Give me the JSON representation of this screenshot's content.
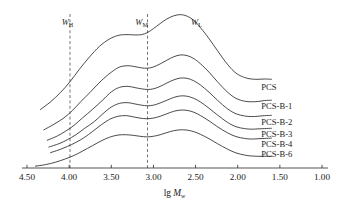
{
  "chart_data": {
    "type": "line",
    "title": "",
    "xlabel": "lg Mw",
    "xlabel_parts": {
      "prefix": "lg ",
      "symbol": "M",
      "subscript": "w"
    },
    "ylabel": "",
    "xlim": [
      4.5,
      1.0
    ],
    "x_axis_reversed": true,
    "xticks": [
      4.5,
      4.0,
      3.5,
      3.0,
      2.5,
      2.0,
      1.5,
      1.0
    ],
    "xticklabels": [
      "4.50",
      "4.00",
      "3.50",
      "3.00",
      "2.50",
      "2.00",
      "1.50",
      "1.00"
    ],
    "grid": false,
    "y_axis_visible": false,
    "legend_position": "right-inline",
    "note": "GPC molecular weight distribution traces, vertically offset; curves are bimodal with a shoulder near lg Mw 3.4 and a main peak near lg Mw 2.7",
    "annotations": [
      {
        "text": "WH",
        "symbol": "W",
        "subscript": "H",
        "x": 4.02,
        "y_frac": 0.93
      },
      {
        "text": "WM",
        "symbol": "W",
        "subscript": "M",
        "x": 3.14,
        "y_frac": 0.93
      },
      {
        "text": "WL",
        "symbol": "W",
        "subscript": "L",
        "x": 2.49,
        "y_frac": 0.93
      }
    ],
    "guide_lines": [
      {
        "x": 3.99,
        "style": "dashed"
      },
      {
        "x": 3.07,
        "style": "dashed"
      }
    ],
    "series": [
      {
        "name": "PCS",
        "label_x": 1.72,
        "label_y_frac": 0.525,
        "x": [
          4.34,
          4.22,
          4.1,
          3.99,
          3.88,
          3.76,
          3.64,
          3.52,
          3.41,
          3.3,
          3.22,
          3.14,
          3.07,
          3.0,
          2.92,
          2.84,
          2.76,
          2.68,
          2.6,
          2.52,
          2.44,
          2.34,
          2.24,
          2.12,
          2.02,
          1.92,
          1.84,
          1.76,
          1.68,
          1.6
        ],
        "values": [
          0.38,
          0.43,
          0.492,
          0.56,
          0.64,
          0.72,
          0.79,
          0.838,
          0.862,
          0.866,
          0.864,
          0.866,
          0.88,
          0.905,
          0.938,
          0.968,
          0.988,
          0.996,
          0.986,
          0.958,
          0.91,
          0.84,
          0.762,
          0.672,
          0.616,
          0.588,
          0.578,
          0.576,
          0.578,
          0.576
        ]
      },
      {
        "name": "PCS-B-1",
        "label_x": 1.72,
        "label_y_frac": 0.4,
        "x": [
          4.3,
          4.18,
          4.06,
          3.96,
          3.86,
          3.74,
          3.62,
          3.5,
          3.4,
          3.3,
          3.22,
          3.14,
          3.07,
          3.0,
          2.92,
          2.84,
          2.76,
          2.68,
          2.6,
          2.52,
          2.44,
          2.34,
          2.24,
          2.12,
          2.02,
          1.92,
          1.84,
          1.76,
          1.68,
          1.6
        ],
        "values": [
          0.248,
          0.284,
          0.326,
          0.374,
          0.432,
          0.498,
          0.566,
          0.622,
          0.656,
          0.664,
          0.658,
          0.65,
          0.648,
          0.656,
          0.676,
          0.7,
          0.722,
          0.734,
          0.73,
          0.71,
          0.676,
          0.622,
          0.56,
          0.492,
          0.452,
          0.434,
          0.43,
          0.432,
          0.438,
          0.44
        ]
      },
      {
        "name": "PCS-B-2",
        "label_x": 1.72,
        "label_y_frac": 0.3,
        "x": [
          4.26,
          4.14,
          4.04,
          3.94,
          3.84,
          3.72,
          3.6,
          3.5,
          3.4,
          3.3,
          3.22,
          3.14,
          3.07,
          3.0,
          2.92,
          2.84,
          2.76,
          2.68,
          2.6,
          2.52,
          2.44,
          2.34,
          2.24,
          2.12,
          2.02,
          1.92,
          1.84,
          1.76,
          1.68,
          1.6
        ],
        "values": [
          0.18,
          0.208,
          0.24,
          0.278,
          0.326,
          0.382,
          0.442,
          0.494,
          0.524,
          0.53,
          0.522,
          0.514,
          0.51,
          0.514,
          0.53,
          0.552,
          0.572,
          0.584,
          0.582,
          0.566,
          0.538,
          0.492,
          0.44,
          0.384,
          0.352,
          0.338,
          0.334,
          0.336,
          0.34,
          0.342
        ]
      },
      {
        "name": "PCS-B-3",
        "label_x": 1.72,
        "label_y_frac": 0.218,
        "x": [
          4.24,
          4.12,
          4.02,
          3.92,
          3.82,
          3.7,
          3.6,
          3.5,
          3.4,
          3.3,
          3.22,
          3.14,
          3.07,
          3.0,
          2.92,
          2.84,
          2.76,
          2.68,
          2.6,
          2.52,
          2.44,
          2.34,
          2.24,
          2.12,
          2.02,
          1.92,
          1.84,
          1.76,
          1.68,
          1.6
        ],
        "values": [
          0.136,
          0.158,
          0.184,
          0.216,
          0.256,
          0.302,
          0.352,
          0.396,
          0.42,
          0.424,
          0.416,
          0.408,
          0.404,
          0.408,
          0.422,
          0.44,
          0.458,
          0.468,
          0.466,
          0.452,
          0.428,
          0.388,
          0.344,
          0.296,
          0.268,
          0.256,
          0.252,
          0.254,
          0.256,
          0.258
        ]
      },
      {
        "name": "PCS-B-4",
        "label_x": 1.72,
        "label_y_frac": 0.158,
        "x": [
          4.22,
          4.12,
          4.02,
          3.92,
          3.82,
          3.72,
          3.62,
          3.52,
          3.42,
          3.32,
          3.24,
          3.16,
          3.08,
          3.0,
          2.92,
          2.84,
          2.76,
          2.68,
          2.6,
          2.52,
          2.44,
          2.34,
          2.24,
          2.12,
          2.02,
          1.92,
          1.84,
          1.76,
          1.68,
          1.6
        ],
        "values": [
          0.1,
          0.118,
          0.14,
          0.166,
          0.198,
          0.238,
          0.28,
          0.316,
          0.336,
          0.34,
          0.332,
          0.324,
          0.32,
          0.324,
          0.336,
          0.352,
          0.368,
          0.376,
          0.374,
          0.362,
          0.34,
          0.306,
          0.268,
          0.228,
          0.204,
          0.192,
          0.188,
          0.19,
          0.192,
          0.194
        ]
      },
      {
        "name": "PCS-B-6",
        "label_x": 1.72,
        "label_y_frac": 0.088,
        "x": [
          4.4,
          4.28,
          4.16,
          4.04,
          3.94,
          3.84,
          3.72,
          3.62,
          3.52,
          3.42,
          3.32,
          3.24,
          3.16,
          3.08,
          3.0,
          2.92,
          2.84,
          2.76,
          2.68,
          2.6,
          2.52,
          2.44,
          2.34,
          2.24,
          2.12,
          2.02,
          1.92,
          1.84,
          1.76,
          1.68,
          1.6
        ],
        "values": [
          0.012,
          0.022,
          0.038,
          0.06,
          0.082,
          0.11,
          0.146,
          0.176,
          0.2,
          0.214,
          0.216,
          0.212,
          0.206,
          0.202,
          0.206,
          0.216,
          0.23,
          0.242,
          0.248,
          0.246,
          0.236,
          0.218,
          0.19,
          0.158,
          0.122,
          0.098,
          0.084,
          0.078,
          0.076,
          0.076,
          0.076
        ]
      }
    ]
  }
}
